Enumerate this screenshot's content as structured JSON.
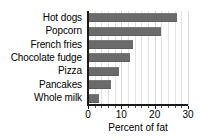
{
  "chart_data": {
    "type": "bar",
    "orientation": "horizontal",
    "title": "",
    "xlabel": "Percent of fat",
    "ylabel": "",
    "categories": [
      "Hot dogs",
      "Popcorn",
      "French fries",
      "Chocolate fudge",
      "Pizza",
      "Pancakes",
      "Whole milk"
    ],
    "values": [
      26.7,
      22,
      13.5,
      12.6,
      9.3,
      7,
      3.3
    ],
    "xlim": [
      0,
      30
    ],
    "xticks": [
      0,
      10,
      20,
      30
    ],
    "xtick_labels": [
      "0",
      "10",
      "20",
      "30"
    ],
    "minor_tick_step": 2,
    "grid": true,
    "grid_axis": "x",
    "legend": false,
    "bar_color": "#6b6b6b",
    "axis_color": "#1a1a1a",
    "grid_color": "#e2e2e2",
    "background": "#ffffff"
  }
}
